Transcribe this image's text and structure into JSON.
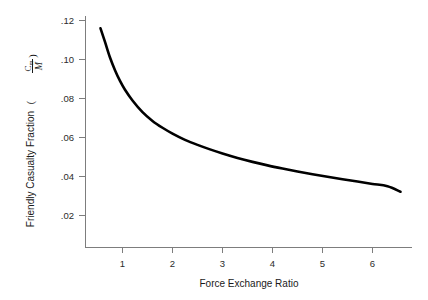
{
  "chart_data": {
    "type": "line",
    "title": "",
    "xlabel": "Force Exchange Ratio",
    "ylabel": "Friendly Casualty Fraction",
    "ylabel_units": "Cm/M",
    "ylabel_numerator": "C",
    "ylabel_numerator_sub": "m",
    "ylabel_denominator": "M",
    "xlim": [
      0,
      6.9
    ],
    "ylim": [
      0,
      0.128
    ],
    "xticks": [
      1,
      2,
      3,
      4,
      5,
      6
    ],
    "xtick_labels": [
      "1",
      "2",
      "3",
      "4",
      "5",
      "6"
    ],
    "yticks": [
      0.02,
      0.04,
      0.06,
      0.08,
      0.1,
      0.12
    ],
    "ytick_labels": [
      ".02",
      ".04",
      ".06",
      ".08",
      ".10",
      ".12"
    ],
    "grid": false,
    "legend": false,
    "series": [
      {
        "name": "Friendly Casualty Fraction",
        "color": "#000000",
        "x": [
          0.56,
          0.65,
          0.75,
          0.85,
          0.95,
          1.05,
          1.2,
          1.4,
          1.6,
          1.8,
          2.0,
          2.25,
          2.5,
          2.75,
          3.0,
          3.3,
          3.6,
          3.9,
          4.2,
          4.5,
          4.8,
          5.1,
          5.4,
          5.7,
          6.0,
          6.3,
          6.56
        ],
        "y": [
          0.116,
          0.109,
          0.101,
          0.0945,
          0.089,
          0.0845,
          0.079,
          0.073,
          0.0685,
          0.065,
          0.062,
          0.0588,
          0.0562,
          0.0539,
          0.0518,
          0.0495,
          0.0475,
          0.0457,
          0.0441,
          0.0426,
          0.0412,
          0.0399,
          0.0386,
          0.0374,
          0.0362,
          0.035,
          0.0322
        ]
      }
    ],
    "annotations": []
  },
  "axes": {
    "y_title_main": "Friendly Casualty Fraction"
  }
}
